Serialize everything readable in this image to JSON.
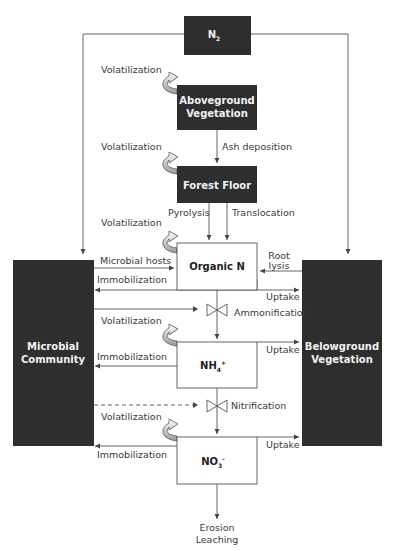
{
  "diagram": {
    "colors": {
      "dark_box": "#2e2e2e",
      "light_box_border": "#555555",
      "line": "#555555",
      "text": "#3a3a3a",
      "volatilization_arrow": "#b0b0b0"
    },
    "nodes": {
      "n2": {
        "label": "N",
        "sub": "2"
      },
      "aboveground": {
        "line1": "Aboveground",
        "line2": "Vegetation"
      },
      "forest_floor": {
        "label": "Forest Floor"
      },
      "organic_n": {
        "label": "Organic N"
      },
      "nh4": {
        "label": "NH",
        "sub": "4",
        "sup": "+"
      },
      "no3": {
        "label": "NO",
        "sub": "3",
        "sup": "-"
      },
      "microbial": {
        "line1": "Microbial",
        "line2": "Community"
      },
      "belowground": {
        "line1": "Belowground",
        "line2": "Vegetation"
      }
    },
    "flows": {
      "volatilization_1": "Volatilization",
      "volatilization_2": "Volatilization",
      "volatilization_3": "Volatilization",
      "volatilization_4": "Volatilization",
      "volatilization_5": "Volatilization",
      "ash_deposition": "Ash deposition",
      "pyrolysis": "Pyrolysis",
      "translocation": "Translocation",
      "microbial_hosts": "Microbial hosts",
      "immobilization_1": "Immobilization",
      "immobilization_2": "Immobilization",
      "immobilization_3": "Immobilization",
      "root_lysis_1": "Root",
      "root_lysis_2": "lysis",
      "uptake_1": "Uptake",
      "uptake_2": "Uptake",
      "uptake_3": "Uptake",
      "ammonification": "Ammonification",
      "nitrification": "Nitrification",
      "erosion": "Erosion",
      "leaching": "Leaching"
    }
  }
}
